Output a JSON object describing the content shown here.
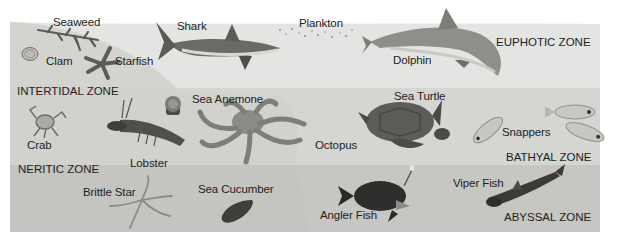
{
  "diagram": {
    "zones": [
      {
        "id": "euphotic",
        "label": "EUPHOTIC ZONE"
      },
      {
        "id": "intertidal",
        "label": "INTERTIDAL ZONE"
      },
      {
        "id": "neritic",
        "label": "NERITIC ZONE"
      },
      {
        "id": "bathyal",
        "label": "BATHYAL ZONE"
      },
      {
        "id": "abyssal",
        "label": "ABYSSAL ZONE"
      }
    ],
    "organisms": [
      {
        "id": "seaweed",
        "label": "Seaweed",
        "zone": "intertidal"
      },
      {
        "id": "clam",
        "label": "Clam",
        "zone": "intertidal"
      },
      {
        "id": "starfish",
        "label": "Starfish",
        "zone": "intertidal"
      },
      {
        "id": "shark",
        "label": "Shark",
        "zone": "euphotic"
      },
      {
        "id": "plankton",
        "label": "Plankton",
        "zone": "euphotic"
      },
      {
        "id": "dolphin",
        "label": "Dolphin",
        "zone": "euphotic"
      },
      {
        "id": "crab",
        "label": "Crab",
        "zone": "neritic"
      },
      {
        "id": "lobster",
        "label": "Lobster",
        "zone": "neritic"
      },
      {
        "id": "sea_anemone",
        "label": "Sea Anemone",
        "zone": "neritic"
      },
      {
        "id": "octopus",
        "label": "Octopus",
        "zone": "neritic"
      },
      {
        "id": "sea_turtle",
        "label": "Sea Turtle",
        "zone": "bathyal"
      },
      {
        "id": "snappers",
        "label": "Snappers",
        "zone": "bathyal"
      },
      {
        "id": "brittle_star",
        "label": "Brittle Star",
        "zone": "abyssal"
      },
      {
        "id": "sea_cucumber",
        "label": "Sea Cucumber",
        "zone": "abyssal"
      },
      {
        "id": "angler_fish",
        "label": "Angler Fish",
        "zone": "abyssal"
      },
      {
        "id": "viper_fish",
        "label": "Viper Fish",
        "zone": "abyssal"
      }
    ]
  },
  "colors": {
    "euphotic": "#e3e3e1",
    "shelf": "#cfcfcc",
    "bathyal": "#d2d2cf",
    "abyssal": "#c4c4c1",
    "text": "#1e1e1e"
  }
}
